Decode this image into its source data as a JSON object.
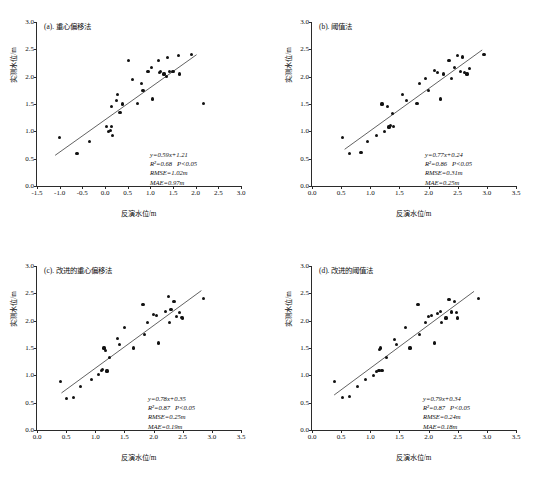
{
  "figure": {
    "axis_label_x": "反演水位/m",
    "axis_label_y": "实测水位/m",
    "line_color": "#3a3a3a",
    "marker_color": "#111111"
  },
  "chart_data": [
    {
      "type": "scatter",
      "panel": "a",
      "title": "(a). 重心偏移法",
      "xlabel": "反演水位/m",
      "ylabel": "实测水位/m",
      "xlim": [
        -1.5,
        3.0
      ],
      "ylim": [
        0.0,
        3.0
      ],
      "xticks": [
        -1.5,
        -1.0,
        -0.5,
        0.0,
        0.5,
        1.0,
        1.5,
        2.0,
        2.5,
        3.0
      ],
      "xticklabels": [
        "-1.5",
        "-1.0",
        "-0.5",
        "0.0",
        "0.5",
        "1.0",
        "1.5",
        "2.0",
        "2.5",
        "3.0"
      ],
      "yticks": [
        0.0,
        0.5,
        1.0,
        1.5,
        2.0,
        2.5,
        3.0
      ],
      "yticklabels": [
        "0.0",
        "0.5",
        "1.0",
        "1.5",
        "2.0",
        "2.5",
        "3.0"
      ],
      "grid": false,
      "fit_line": {
        "slope": 0.59,
        "intercept": 1.21,
        "x_start": -1.1,
        "x_end": 2.02
      },
      "x": [
        -1.0,
        -0.63,
        -0.6,
        -0.35,
        0.04,
        0.08,
        0.12,
        0.14,
        0.15,
        0.17,
        0.25,
        0.27,
        0.33,
        0.38,
        0.52,
        0.6,
        0.72,
        0.8,
        0.84,
        0.95,
        1.02,
        1.05,
        1.18,
        1.2,
        1.22,
        1.3,
        1.35,
        1.38,
        1.42,
        1.5,
        1.62,
        1.65,
        1.9,
        2.18
      ],
      "y": [
        0.89,
        0.59,
        0.6,
        0.81,
        1.09,
        1.0,
        1.02,
        1.09,
        1.45,
        0.92,
        1.57,
        1.67,
        1.34,
        1.5,
        2.29,
        1.95,
        1.51,
        1.88,
        1.74,
        2.1,
        2.17,
        1.59,
        2.3,
        2.07,
        2.1,
        2.05,
        2.0,
        2.35,
        2.09,
        2.1,
        2.38,
        2.05,
        2.4,
        1.51
      ],
      "annotations": {
        "equation": "y=0.59x+1.21",
        "r_squared": "R²=0.68",
        "p_value": "P<0.05",
        "rmse": "RMSE=1.02m",
        "mae": "MAE=0.97m"
      }
    },
    {
      "type": "scatter",
      "panel": "b",
      "title": "(b). 阈值法",
      "xlabel": "反演水位/m",
      "ylabel": "实测水位/m",
      "xlim": [
        0.0,
        3.5
      ],
      "ylim": [
        0.0,
        3.0
      ],
      "xticks": [
        0.0,
        0.5,
        1.0,
        1.5,
        2.0,
        2.5,
        3.0,
        3.5
      ],
      "xticklabels": [
        "0.0",
        "0.5",
        "1.0",
        "1.5",
        "2.0",
        "2.5",
        "3.0",
        "3.5"
      ],
      "yticks": [
        0.0,
        0.5,
        1.0,
        1.5,
        2.0,
        2.5,
        3.0
      ],
      "yticklabels": [
        "0.0",
        "0.5",
        "1.0",
        "1.5",
        "2.0",
        "2.5",
        "3.0"
      ],
      "grid": false,
      "fit_line": {
        "slope": 0.77,
        "intercept": 0.24,
        "x_start": 0.56,
        "x_end": 2.92
      },
      "x": [
        0.52,
        0.65,
        0.84,
        0.95,
        1.1,
        1.2,
        1.25,
        1.3,
        1.32,
        1.35,
        1.38,
        1.4,
        1.55,
        1.62,
        1.8,
        1.85,
        1.95,
        2.0,
        2.1,
        2.15,
        2.2,
        2.25,
        2.35,
        2.4,
        2.45,
        2.5,
        2.55,
        2.58,
        2.62,
        2.66,
        2.7,
        2.95
      ],
      "y": [
        0.89,
        0.59,
        0.62,
        0.81,
        0.92,
        1.5,
        1.0,
        1.45,
        1.08,
        1.1,
        1.33,
        1.09,
        1.67,
        1.57,
        1.51,
        1.88,
        1.96,
        1.75,
        2.12,
        2.07,
        1.59,
        2.05,
        2.3,
        1.97,
        2.17,
        2.38,
        2.1,
        2.36,
        2.07,
        2.05,
        2.15,
        2.4
      ],
      "annotations": {
        "equation": "y=0.77x+0.24",
        "r_squared": "R²=0.86",
        "p_value": "P<0.05",
        "rmse": "RMSE=0.31m",
        "mae": "MAE=0.25m"
      }
    },
    {
      "type": "scatter",
      "panel": "c",
      "title": "(c). 改进的重心偏移法",
      "xlabel": "反演水位/m",
      "ylabel": "实测水位/m",
      "xlim": [
        0.0,
        3.5
      ],
      "ylim": [
        0.0,
        3.0
      ],
      "xticks": [
        0.0,
        0.5,
        1.0,
        1.5,
        2.0,
        2.5,
        3.0,
        3.5
      ],
      "xticklabels": [
        "0.0",
        "0.5",
        "1.0",
        "1.5",
        "2.0",
        "2.5",
        "3.0",
        "3.5"
      ],
      "yticks": [
        0.0,
        0.5,
        1.0,
        1.5,
        2.0,
        2.5,
        3.0
      ],
      "yticklabels": [
        "0.0",
        "0.5",
        "1.0",
        "1.5",
        "2.0",
        "2.5",
        "3.0"
      ],
      "grid": false,
      "fit_line": {
        "slope": 0.78,
        "intercept": 0.35,
        "x_start": 0.42,
        "x_end": 2.82
      },
      "x": [
        0.4,
        0.5,
        0.62,
        0.75,
        0.93,
        1.05,
        1.1,
        1.13,
        1.15,
        1.18,
        1.2,
        1.25,
        1.38,
        1.42,
        1.5,
        1.65,
        1.82,
        1.85,
        1.9,
        2.0,
        2.05,
        2.08,
        2.2,
        2.25,
        2.28,
        2.3,
        2.35,
        2.4,
        2.45,
        2.48,
        2.5,
        2.85
      ],
      "y": [
        0.89,
        0.58,
        0.6,
        0.8,
        0.92,
        1.01,
        1.09,
        1.1,
        1.5,
        1.46,
        1.08,
        1.33,
        1.67,
        1.57,
        1.87,
        1.5,
        2.29,
        1.75,
        1.96,
        2.12,
        2.1,
        1.59,
        2.17,
        2.44,
        1.97,
        2.2,
        2.35,
        2.07,
        2.15,
        2.06,
        2.05,
        2.4
      ],
      "annotations": {
        "equation": "y=0.78x+0.35",
        "r_squared": "R²=0.87",
        "p_value": "P<0.05",
        "rmse": "RMSE=0.25m",
        "mae": "MAE=0.19m"
      }
    },
    {
      "type": "scatter",
      "panel": "d",
      "title": "(d). 改进的阈值法",
      "xlabel": "反演水位/m",
      "ylabel": "实测水位/m",
      "xlim": [
        0.0,
        3.5
      ],
      "ylim": [
        0.0,
        3.0
      ],
      "xticks": [
        0.0,
        0.5,
        1.0,
        1.5,
        2.0,
        2.5,
        3.0,
        3.5
      ],
      "xticklabels": [
        "0.0",
        "0.5",
        "1.0",
        "1.5",
        "2.0",
        "2.5",
        "3.0",
        "3.5"
      ],
      "yticks": [
        0.0,
        0.5,
        1.0,
        1.5,
        2.0,
        2.5,
        3.0
      ],
      "yticklabels": [
        "0.0",
        "0.5",
        "1.0",
        "1.5",
        "2.0",
        "2.5",
        "3.0"
      ],
      "grid": false,
      "fit_line": {
        "slope": 0.79,
        "intercept": 0.34,
        "x_start": 0.38,
        "x_end": 2.78
      },
      "x": [
        0.38,
        0.52,
        0.65,
        0.78,
        0.92,
        1.05,
        1.1,
        1.15,
        1.16,
        1.18,
        1.2,
        1.28,
        1.42,
        1.45,
        1.6,
        1.68,
        1.82,
        1.85,
        1.95,
        2.0,
        2.05,
        2.1,
        2.15,
        2.2,
        2.22,
        2.3,
        2.35,
        2.4,
        2.45,
        2.48,
        2.5,
        2.85
      ],
      "y": [
        0.89,
        0.59,
        0.61,
        0.8,
        0.92,
        1.0,
        1.07,
        1.09,
        1.47,
        1.5,
        1.09,
        1.33,
        1.66,
        1.57,
        1.87,
        1.5,
        2.29,
        1.74,
        1.96,
        2.08,
        2.1,
        1.59,
        2.13,
        2.17,
        1.97,
        2.05,
        2.38,
        2.16,
        2.35,
        2.15,
        2.05,
        2.4
      ],
      "annotations": {
        "equation": "y=0.79x+0.34",
        "r_squared": "R²=0.87",
        "p_value": "P<0.05",
        "rmse": "RMSE=0.24m",
        "mae": "MAE=0.18m"
      }
    }
  ]
}
